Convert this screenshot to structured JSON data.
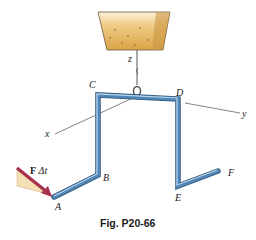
{
  "figure": {
    "caption": "Fig. P20-66",
    "points": {
      "A": "A",
      "B": "B",
      "C": "C",
      "D": "D",
      "E": "E",
      "F": "F"
    },
    "axes": {
      "x": "x",
      "y": "y",
      "z": "z"
    },
    "impulse_label_bold": "F",
    "impulse_label_rest": " Δt",
    "colors": {
      "rod": "#3d6f99",
      "rod_highlight": "#a9cbe6",
      "arrow": "#a8324e",
      "impulse_triangle": "#f5dfb4",
      "hopper": "#e4b45e"
    }
  }
}
